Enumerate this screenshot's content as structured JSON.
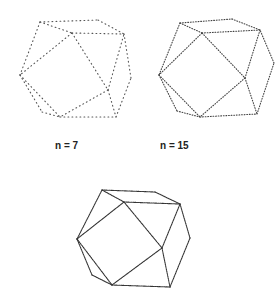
{
  "figure": {
    "panels": [
      {
        "id": "p1",
        "label": "n = 7",
        "x": 0,
        "y": 0,
        "w": 140,
        "h": 135,
        "label_x": 55,
        "label_y": 140,
        "dash": "0.8 3.2",
        "stroke": "#555555",
        "stroke_width": 1.1,
        "vertices": {
          "A": [
            40,
            22
          ],
          "B": [
            98,
            20
          ],
          "C": [
            124,
            34
          ],
          "D": [
            72,
            33
          ],
          "E": [
            20,
            75
          ],
          "F": [
            131,
            78
          ],
          "G": [
            42,
            112
          ],
          "H": [
            60,
            117
          ],
          "I": [
            116,
            117
          ],
          "J": [
            108,
            90
          ]
        },
        "edges": [
          [
            "A",
            "B"
          ],
          [
            "B",
            "C"
          ],
          [
            "A",
            "D"
          ],
          [
            "D",
            "C"
          ],
          [
            "A",
            "E"
          ],
          [
            "E",
            "G"
          ],
          [
            "G",
            "H"
          ],
          [
            "H",
            "I"
          ],
          [
            "I",
            "F"
          ],
          [
            "F",
            "C"
          ],
          [
            "D",
            "J"
          ],
          [
            "J",
            "H"
          ],
          [
            "D",
            "E"
          ],
          [
            "J",
            "C"
          ],
          [
            "J",
            "I"
          ],
          [
            "E",
            "H"
          ]
        ]
      },
      {
        "id": "p2",
        "label": "n = 15",
        "x": 140,
        "y": 0,
        "w": 140,
        "h": 135,
        "label_x": 160,
        "label_y": 140,
        "dash": "0.8 1.8",
        "stroke": "#444444",
        "stroke_width": 1.1,
        "vertices": {
          "A": [
            40,
            23
          ],
          "B": [
            92,
            19
          ],
          "C": [
            120,
            30
          ],
          "D": [
            62,
            33
          ],
          "E": [
            19,
            75
          ],
          "F": [
            134,
            63
          ],
          "G": [
            37,
            111
          ],
          "H": [
            60,
            117
          ],
          "I": [
            117,
            114
          ],
          "J": [
            105,
            78
          ]
        },
        "edges": [
          [
            "A",
            "B"
          ],
          [
            "B",
            "C"
          ],
          [
            "A",
            "D"
          ],
          [
            "D",
            "C"
          ],
          [
            "A",
            "E"
          ],
          [
            "E",
            "G"
          ],
          [
            "G",
            "H"
          ],
          [
            "H",
            "I"
          ],
          [
            "I",
            "F"
          ],
          [
            "F",
            "C"
          ],
          [
            "D",
            "J"
          ],
          [
            "J",
            "H"
          ],
          [
            "D",
            "E"
          ],
          [
            "J",
            "C"
          ],
          [
            "J",
            "I"
          ],
          [
            "E",
            "H"
          ]
        ]
      },
      {
        "id": "p3",
        "label": "",
        "x": 60,
        "y": 160,
        "w": 160,
        "h": 144,
        "label_x": 0,
        "label_y": 0,
        "dash": "1 0.8",
        "stroke": "#333333",
        "stroke_width": 1.1,
        "vertices": {
          "A": [
            42,
            30
          ],
          "B": [
            95,
            32
          ],
          "C": [
            120,
            44
          ],
          "D": [
            64,
            42
          ],
          "E": [
            17,
            79
          ],
          "F": [
            130,
            78
          ],
          "G": [
            32,
            115
          ],
          "H": [
            52,
            125
          ],
          "I": [
            110,
            127
          ],
          "J": [
            102,
            88
          ]
        },
        "edges": [
          [
            "A",
            "B"
          ],
          [
            "B",
            "C"
          ],
          [
            "A",
            "D"
          ],
          [
            "D",
            "C"
          ],
          [
            "A",
            "E"
          ],
          [
            "E",
            "G"
          ],
          [
            "G",
            "H"
          ],
          [
            "H",
            "I"
          ],
          [
            "I",
            "F"
          ],
          [
            "F",
            "C"
          ],
          [
            "D",
            "J"
          ],
          [
            "J",
            "H"
          ],
          [
            "D",
            "E"
          ],
          [
            "J",
            "C"
          ],
          [
            "J",
            "I"
          ],
          [
            "E",
            "H"
          ]
        ]
      }
    ]
  }
}
